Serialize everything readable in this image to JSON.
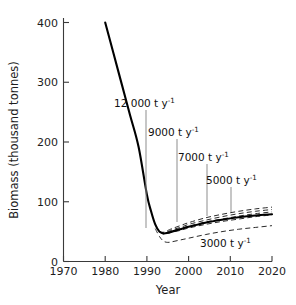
{
  "chart_data": {
    "type": "line",
    "title": "",
    "xlabel": "Year",
    "ylabel": "Biomass (thousand tonnes)",
    "xlim": [
      1970,
      2020
    ],
    "ylim": [
      0,
      400
    ],
    "xticks": [
      1970,
      1980,
      1990,
      2000,
      2010,
      2020
    ],
    "yticks": [
      0,
      100,
      200,
      300,
      400
    ],
    "grid": false,
    "legend": "none (inline annotations with leader lines)",
    "series": [
      {
        "name": "historical and projected biomass (baseline)",
        "style": "solid",
        "x": [
          1980,
          1982,
          1984,
          1986,
          1988,
          1990,
          1991,
          1992,
          1993,
          1994,
          1995,
          1996,
          1998,
          2000,
          2004,
          2008,
          2012,
          2016,
          2020
        ],
        "values": [
          400,
          348,
          296,
          244,
          192,
          112,
          84,
          62,
          50,
          47,
          48,
          50,
          54,
          58,
          65,
          70,
          74,
          77,
          79
        ]
      },
      {
        "name": "12000 t y-1",
        "style": "dashed",
        "x": [
          1993,
          1994,
          1995,
          1996,
          1998,
          2000,
          2004,
          2008,
          2012,
          2016,
          2020
        ],
        "values": [
          50,
          49,
          52,
          55,
          60,
          65,
          73,
          79,
          84,
          88,
          91
        ]
      },
      {
        "name": "9000 t y-1",
        "style": "dashed",
        "x": [
          1993,
          1994,
          1995,
          1996,
          1998,
          2000,
          2004,
          2008,
          2012,
          2016,
          2020
        ],
        "values": [
          50,
          48,
          50,
          53,
          57,
          62,
          69,
          75,
          80,
          84,
          87
        ]
      },
      {
        "name": "7000 t y-1",
        "style": "dashed",
        "x": [
          1993,
          1994,
          1995,
          1996,
          1998,
          2000,
          2004,
          2008,
          2012,
          2016,
          2020
        ],
        "values": [
          50,
          47,
          49,
          51,
          55,
          59,
          66,
          71,
          76,
          80,
          83
        ]
      },
      {
        "name": "5000 t y-1",
        "style": "dashed",
        "x": [
          1993,
          1994,
          1995,
          1996,
          1998,
          2000,
          2004,
          2008,
          2012,
          2016,
          2020
        ],
        "values": [
          50,
          46,
          47,
          49,
          52,
          56,
          62,
          67,
          71,
          75,
          78
        ]
      },
      {
        "name": "3000 t y-1",
        "style": "dashed",
        "x": [
          1992,
          1993,
          1994,
          1995,
          1996,
          1998,
          2000,
          2004,
          2008,
          2012,
          2016,
          2020
        ],
        "values": [
          55,
          42,
          34,
          32,
          33,
          36,
          39,
          45,
          50,
          54,
          57,
          60
        ]
      }
    ],
    "annotations": [
      {
        "id": "a12000",
        "value": "12 000",
        "unit": "t y",
        "exponent": "-1",
        "text_x": 147,
        "text_y": 104,
        "leader_x": 146,
        "leader_y1": 110,
        "leader_y2": 228
      },
      {
        "id": "a9000",
        "value": "9000",
        "unit": "t y",
        "exponent": "-1",
        "text_x": 176,
        "text_y": 133,
        "leader_x": 177,
        "leader_y1": 139,
        "leader_y2": 222
      },
      {
        "id": "a7000",
        "value": "7000",
        "unit": "t y",
        "exponent": "-1",
        "text_x": 200,
        "text_y": 158,
        "leader_x": 207,
        "leader_y1": 164,
        "leader_y2": 216
      },
      {
        "id": "a5000",
        "value": "5000",
        "unit": "t y",
        "exponent": "-1",
        "text_x": 224,
        "text_y": 181,
        "leader_x": 231,
        "leader_y1": 187,
        "leader_y2": 213
      },
      {
        "id": "a3000",
        "value": "3000",
        "unit": "t y",
        "exponent": "-1",
        "text_x": 219,
        "text_y": 244,
        "leader_x": 0,
        "leader_y1": 0,
        "leader_y2": 0
      }
    ]
  },
  "axes": {
    "y_label": "Biomass (thousand tonnes)",
    "x_label": "Year",
    "y_tick_labels": [
      "0",
      "100",
      "200",
      "300",
      "400"
    ],
    "x_tick_labels": [
      "1970",
      "1980",
      "1990",
      "2000",
      "2010",
      "2020"
    ]
  },
  "colors": {
    "axis": "#3a3a3a",
    "solid_series": "#000000",
    "dashed_series": "#2a2a2a",
    "leader": "#8d8d8d",
    "text": "#111111",
    "background": "#ffffff"
  }
}
